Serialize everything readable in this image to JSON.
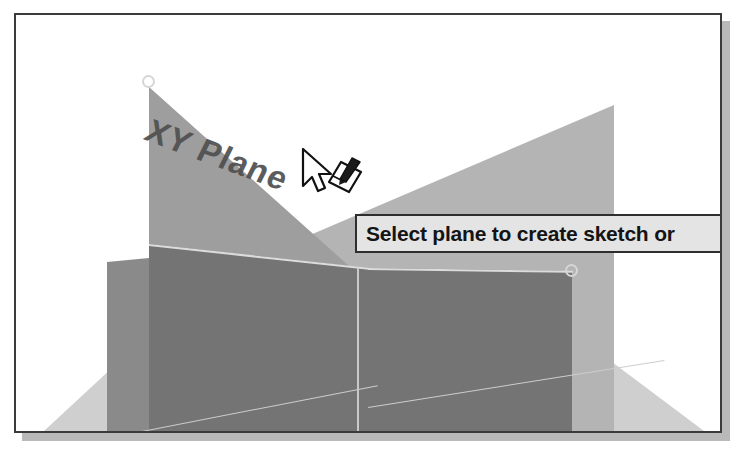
{
  "app": {
    "type": "cad-3d-viewport",
    "description": "CAD modeling application 3D viewport with datum planes"
  },
  "viewport": {
    "name": "3d-viewport",
    "background_color": "#ffffff",
    "border_color": "#3b3b3b"
  },
  "scene": {
    "planes": [
      {
        "label": "XY Plane",
        "role": "datum-plane-xy",
        "color": "#9e9e9e",
        "highlighted": true
      },
      {
        "label": "",
        "role": "datum-plane-right",
        "color": "#b4b4b4",
        "highlighted": false
      },
      {
        "label": "",
        "role": "datum-plane-ground",
        "color": "#cfcfcf",
        "highlighted": false
      },
      {
        "label": "",
        "role": "solid-body-front-face",
        "color": "#747474",
        "highlighted": false
      }
    ],
    "xy_plane_label": "XY Plane",
    "label_color": "#4f4f4f",
    "handles": [
      {
        "name": "plane-corner-handle-top",
        "x": 133,
        "y": 67
      },
      {
        "name": "plane-corner-handle-right",
        "x": 556,
        "y": 256
      }
    ]
  },
  "tooltip": {
    "text": "Select plane to create sketch or",
    "truncated": true,
    "background_color": "#e4e4e4",
    "border_color": "#2e2e2e",
    "text_color": "#141414"
  },
  "cursor": {
    "name": "select-plane-cursor",
    "type": "arrow-with-sketch-glyph",
    "x": 300,
    "y": 140
  }
}
